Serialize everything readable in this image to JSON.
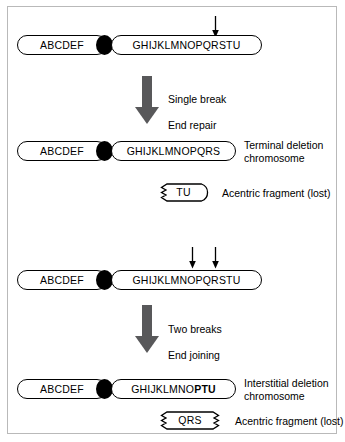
{
  "figure": {
    "width": 345,
    "height": 442,
    "background": "#ffffff",
    "border_color": "#b9b9b9"
  },
  "colors": {
    "outline": "#000000",
    "centromere": "#000000",
    "process_arrow": "#58585a",
    "text": "#000000"
  },
  "panels": {
    "terminal": {
      "parent_chromosome": {
        "short_arm_label": "ABCDEF",
        "long_arm_label": "GHIJKLMNOPQRSTU",
        "break_arrow_count": 1
      },
      "process": {
        "line1": "Single break",
        "line2": "End repair"
      },
      "product_chromosome": {
        "short_arm_label": "ABCDEF",
        "long_arm_label": "GHIJKLMNOPQRS",
        "side_label": "Terminal deletion\nchromosome"
      },
      "fragment": {
        "label": "TU",
        "caption": "Acentric fragment (lost)",
        "jagged_left": true,
        "jagged_right": false
      }
    },
    "interstitial": {
      "parent_chromosome": {
        "short_arm_label": "ABCDEF",
        "long_arm_label": "GHIJKLMNOPQRSTU",
        "break_arrow_count": 2
      },
      "process": {
        "line1": "Two breaks",
        "line2": "End joining"
      },
      "product_chromosome": {
        "short_arm_label": "ABCDEF",
        "long_arm_label_normal": "GHIJKLMNO",
        "long_arm_label_bold": "PTU",
        "side_label": "Interstitial deletion\nchromosome"
      },
      "fragment": {
        "label": "QRS",
        "caption": "Acentric fragment (lost)",
        "jagged_left": true,
        "jagged_right": true
      }
    }
  }
}
